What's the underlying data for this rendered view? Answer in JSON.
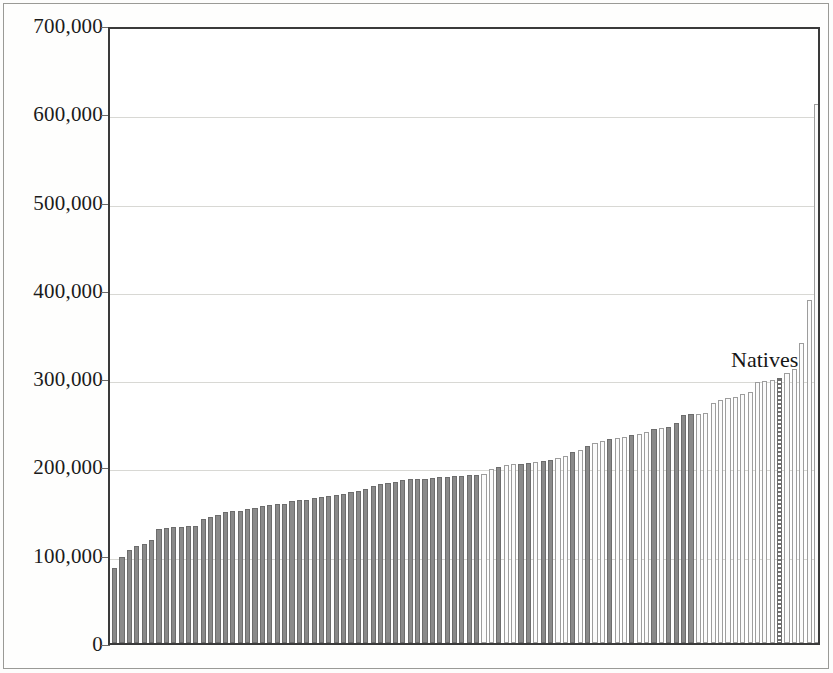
{
  "figure": {
    "name": "bar-chart-figure",
    "background_color": "#ffffff",
    "frame_color": "#9a9a96"
  },
  "annotations": [
    {
      "text": "Natives",
      "x_px": 731,
      "y_px": 349,
      "font_size_px": 22,
      "color": "#161616"
    }
  ],
  "chart_data": {
    "type": "bar",
    "title": "",
    "subtitle": "",
    "xlabel": "",
    "ylabel": "",
    "xlim": [
      0,
      96
    ],
    "ylim": [
      0,
      700000
    ],
    "grid": true,
    "grid_axis": "y",
    "legend": false,
    "legend_position": "none",
    "axis_line_color": "#3a3a3a",
    "gridline_color": "#d8d8d4",
    "ytick_labels": [
      "0",
      "100,000",
      "200,000",
      "300,000",
      "400,000",
      "500,000",
      "600,000",
      "700,000"
    ],
    "ytick_values": [
      0,
      100000,
      200000,
      300000,
      400000,
      500000,
      600000,
      700000
    ],
    "xtick_labels": [],
    "bar_series_styles": {
      "dark": "#8a8a8a",
      "light": "#fbfbfb",
      "dotted": "#6e6e6e"
    },
    "bar_count": 96,
    "values": [
      85000,
      97000,
      105000,
      110000,
      112000,
      117000,
      129000,
      130000,
      131000,
      131000,
      132000,
      133000,
      141000,
      143000,
      145000,
      148000,
      150000,
      150000,
      152000,
      153000,
      155000,
      156000,
      157000,
      158000,
      161000,
      162000,
      162000,
      164000,
      165000,
      166000,
      168000,
      169000,
      171000,
      172000,
      175000,
      178000,
      180000,
      181000,
      182000,
      185000,
      186000,
      186000,
      186000,
      187000,
      188000,
      188000,
      189000,
      189000,
      190000,
      190000,
      192000,
      197000,
      199000,
      202000,
      203000,
      203000,
      204000,
      205000,
      206000,
      207000,
      209000,
      212000,
      216000,
      219000,
      223000,
      226000,
      229000,
      231000,
      232000,
      233000,
      236000,
      237000,
      239000,
      242000,
      243000,
      245000,
      249000,
      258000,
      259000,
      259000,
      260000,
      272000,
      275000,
      277000,
      279000,
      282000,
      284000,
      296000,
      297000,
      298000,
      300000,
      306000,
      310000,
      340000,
      389000,
      610000
    ],
    "styles": [
      "dark",
      "dark",
      "dark",
      "dark",
      "dark",
      "dark",
      "dark",
      "dark",
      "dark",
      "dark",
      "dark",
      "dark",
      "dark",
      "dark",
      "dark",
      "dark",
      "dark",
      "dark",
      "dark",
      "dark",
      "dark",
      "dark",
      "dark",
      "dark",
      "dark",
      "dark",
      "dark",
      "dark",
      "dark",
      "dark",
      "dark",
      "dark",
      "dark",
      "dark",
      "dark",
      "dark",
      "dark",
      "dark",
      "dark",
      "dark",
      "dark",
      "dark",
      "dark",
      "dark",
      "dark",
      "dark",
      "dark",
      "dark",
      "dark",
      "dark",
      "light",
      "light",
      "dark",
      "light",
      "light",
      "dark",
      "dark",
      "light",
      "dark",
      "dark",
      "light",
      "light",
      "dark",
      "light",
      "dark",
      "light",
      "light",
      "dark",
      "light",
      "light",
      "dark",
      "light",
      "light",
      "dark",
      "light",
      "dark",
      "dark",
      "dark",
      "dark",
      "light",
      "light",
      "light",
      "light",
      "light",
      "light",
      "light",
      "light",
      "light",
      "light",
      "light",
      "dotted",
      "light",
      "light",
      "light",
      "light",
      "light"
    ],
    "highlighted_bar": {
      "index": 90,
      "label": "Natives",
      "value": 300000,
      "style": "dotted"
    }
  }
}
